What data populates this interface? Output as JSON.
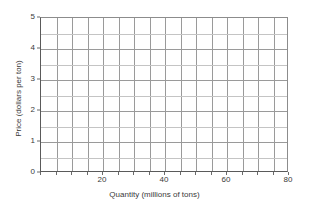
{
  "chart_data": {
    "type": "line",
    "title": "",
    "subtitle": "",
    "xlabel": "Quantity (millions of tons)",
    "ylabel": "Price (dollars per ton)",
    "xlim": [
      0,
      80
    ],
    "ylim": [
      0,
      5
    ],
    "x_tick_labels": [
      "20",
      "40",
      "60",
      "80"
    ],
    "x_tick_values": [
      20,
      40,
      60,
      80
    ],
    "x_tick_step": 5,
    "x_gridline_values": [
      0,
      5,
      10,
      15,
      20,
      25,
      30,
      35,
      40,
      45,
      50,
      55,
      60,
      65,
      70,
      75,
      80
    ],
    "y_tick_labels": [
      "0",
      "1",
      "2",
      "3",
      "4",
      "5"
    ],
    "y_tick_values": [
      0,
      1,
      2,
      3,
      4,
      5
    ],
    "y_tick_step": 0.5,
    "y_gridline_values": [
      0,
      0.5,
      1,
      1.5,
      2,
      2.5,
      3,
      3.5,
      4,
      4.5,
      5
    ],
    "grid": true,
    "legend": null,
    "series": [],
    "annotations": [],
    "note": "Empty grid; no data series plotted"
  },
  "colors": {
    "background": "#ffffff",
    "grid_major": "#9a9a9a",
    "grid_minor": "#c4c4c4",
    "axis": "#5a5a5a",
    "text": "#3a3a3a"
  }
}
